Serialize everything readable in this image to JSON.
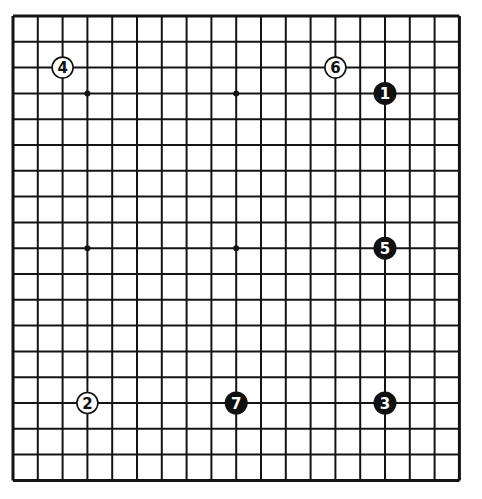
{
  "board": {
    "size": 19,
    "origin_x": 13,
    "origin_y": 16,
    "step_x": 24.8,
    "step_y": 25.8,
    "line_color": "#141414",
    "star_points": [
      [
        3,
        3
      ],
      [
        9,
        3
      ],
      [
        15,
        3
      ],
      [
        3,
        9
      ],
      [
        9,
        9
      ],
      [
        15,
        9
      ],
      [
        3,
        15
      ],
      [
        9,
        15
      ],
      [
        15,
        15
      ]
    ]
  },
  "stones": [
    {
      "number": "1",
      "color": "black",
      "col": 15,
      "row": 3
    },
    {
      "number": "2",
      "color": "white",
      "col": 3,
      "row": 15
    },
    {
      "number": "3",
      "color": "black",
      "col": 15,
      "row": 15
    },
    {
      "number": "4",
      "color": "white",
      "col": 2,
      "row": 2
    },
    {
      "number": "5",
      "color": "black",
      "col": 15,
      "row": 9
    },
    {
      "number": "6",
      "color": "white",
      "col": 13,
      "row": 2
    },
    {
      "number": "7",
      "color": "black",
      "col": 9,
      "row": 15
    }
  ]
}
